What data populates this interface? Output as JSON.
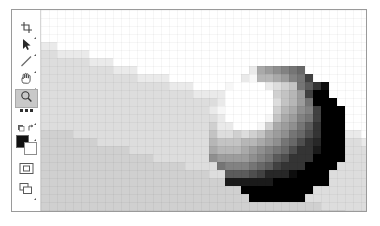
{
  "app": {
    "title": "Image Editor",
    "window_name": "image-editor-window"
  },
  "toolbar": {
    "name": "tools-palette",
    "tools": [
      {
        "id": "crop",
        "label": "Crop Tool",
        "icon": "crop-icon",
        "selected": false,
        "has_submenu": true,
        "y": 11
      },
      {
        "id": "move",
        "label": "Move Tool",
        "icon": "arrow-pointer-icon",
        "selected": false,
        "has_submenu": true,
        "y": 28
      },
      {
        "id": "line",
        "label": "Line Tool",
        "icon": "line-icon",
        "selected": false,
        "has_submenu": true,
        "y": 45
      },
      {
        "id": "hand",
        "label": "Hand Tool",
        "icon": "hand-icon",
        "selected": false,
        "has_submenu": true,
        "y": 62
      },
      {
        "id": "zoom",
        "label": "Zoom Tool",
        "icon": "magnifier-icon",
        "selected": true,
        "has_submenu": false,
        "y": 79
      },
      {
        "id": "more",
        "label": "More Tools",
        "icon": "ellipsis-icon",
        "selected": false,
        "has_submenu": true,
        "y": 97
      },
      {
        "id": "swap",
        "label": "Swap Colors",
        "icon": "swap-colors-icon",
        "selected": false,
        "has_submenu": true,
        "y": 113
      }
    ],
    "colors": {
      "name": "color-swatches",
      "foreground_label": "Foreground Color",
      "background_label": "Background Color",
      "foreground": "#111111",
      "background": "#ffffff",
      "y": 125
    },
    "modes": [
      {
        "id": "quickmask",
        "label": "Quick Mask Mode",
        "icon": "quick-mask-icon",
        "selected": false,
        "has_submenu": false,
        "y": 152
      },
      {
        "id": "screenmode",
        "label": "Screen Mode",
        "icon": "screen-mode-icon",
        "selected": false,
        "has_submenu": true,
        "y": 172
      }
    ]
  },
  "canvas": {
    "name": "image-canvas",
    "zoom_level": "1600%",
    "width_px": 327,
    "height_px": 202,
    "block_size": 8,
    "palette": {
      "white": "#ffffff",
      "sky": "#fdfdfd",
      "ground_light": "#e0e0e0",
      "ground": "#d9d9d9",
      "ground_dark": "#cfcfcf",
      "mid": "#b4b4b4",
      "shadow": "#8c8c8c",
      "dark": "#5a5a5a",
      "darkest": "#1a1a1a"
    },
    "description": "Heavily pixelated grayscale photograph of a glossy sphere resting on a diagonal ground plane",
    "chart_data": {
      "type": "heatmap",
      "title": "Pixelated grayscale image",
      "xlabel": "",
      "ylabel": "",
      "cols": 41,
      "rows": 26,
      "cell": 8,
      "gray_levels": [
        255,
        250,
        240,
        228,
        216,
        204,
        190,
        176,
        160,
        140,
        120,
        96,
        72,
        48,
        26
      ],
      "regions": [
        {
          "name": "sky",
          "gray": 255,
          "note": "upper-right white area above the diagonal horizon"
        },
        {
          "name": "ground",
          "gray": 216,
          "note": "light gray ground filling lower-left and bottom"
        },
        {
          "name": "horizon-edge",
          "gray": 232,
          "note": "stair-stepped diagonal from upper-left down to mid-right"
        },
        {
          "name": "sphere-highlight",
          "gray": 252,
          "note": "bright specular blob on upper-left of sphere"
        },
        {
          "name": "sphere-body",
          "gray": 196,
          "note": "mid-tone body of the sphere"
        },
        {
          "name": "sphere-rim",
          "gray": 120,
          "note": "gray rim arc around top-right of sphere"
        },
        {
          "name": "sphere-terminator",
          "gray": 30,
          "note": "dark crescent shadow on right and bottom of sphere"
        },
        {
          "name": "contact-shadow",
          "gray": 60,
          "note": "dark pixels where sphere meets ground"
        }
      ],
      "sphere": {
        "center_col": 29,
        "center_row": 15,
        "radius_cols": 8
      },
      "horizon": {
        "start": [
          0,
          4
        ],
        "end": [
          41,
          16
        ]
      }
    }
  }
}
